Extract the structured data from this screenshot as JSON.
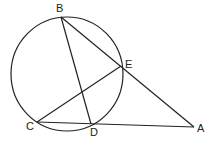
{
  "diagram": {
    "type": "geometry",
    "circle": {
      "cx": 67,
      "cy": 74,
      "rx": 56,
      "ry": 57
    },
    "points": [
      {
        "label": "B",
        "x": 61,
        "y": 17,
        "lx": 56,
        "ly": 12
      },
      {
        "label": "E",
        "x": 121,
        "y": 66,
        "lx": 125,
        "ly": 68
      },
      {
        "label": "C",
        "x": 37,
        "y": 122,
        "lx": 26,
        "ly": 130
      },
      {
        "label": "D",
        "x": 91,
        "y": 124,
        "lx": 90,
        "ly": 136
      },
      {
        "label": "A",
        "x": 194,
        "y": 127,
        "lx": 197,
        "ly": 132
      }
    ],
    "segments": [
      [
        "B",
        "D"
      ],
      [
        "B",
        "A"
      ],
      [
        "C",
        "E"
      ],
      [
        "C",
        "A"
      ]
    ]
  }
}
